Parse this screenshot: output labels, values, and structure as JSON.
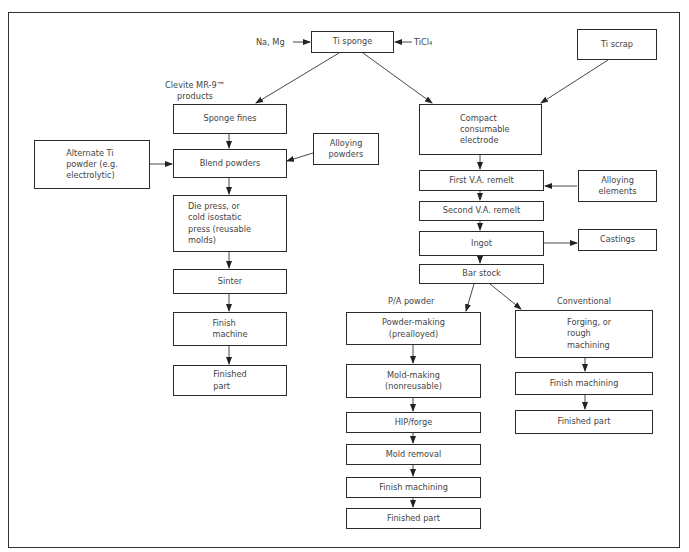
{
  "diagram": {
    "type": "flowchart"
  },
  "nodes": {
    "ti_sponge": "Ti sponge",
    "ti_scrap": "Ti scrap",
    "sponge_fines": "Sponge fines",
    "blend_powders": "Blend powders",
    "alternate_ti": "Alternate Ti\npowder (e.g.\nelectrolytic)",
    "alloying_powders": "Alloying\npowders",
    "die_press": "Die press, or\ncold isostatic\npress (reusable\nmolds)",
    "sinter": "Sinter",
    "finish_machine": "Finish\nmachine",
    "finished_part_left": "Finished\npart",
    "compact_electrode": "Compact\nconsumable\nelectrode",
    "first_va": "First V.A. remelt",
    "alloying_elements": "Alloying\nelements",
    "second_va": "Second V.A. remelt",
    "ingot": "Ingot",
    "castings": "Castings",
    "bar_stock": "Bar stock",
    "powder_making": "Powder-making\n(prealloyed)",
    "mold_making": "Mold-making\n(nonreusable)",
    "hip_forge": "HIP/forge",
    "mold_removal": "Mold removal",
    "finish_machining_pa": "Finish machining",
    "finished_part_pa": "Finished part",
    "forging": "Forging, or\nrough\nmachining",
    "finish_machining_conv": "Finish machining",
    "finished_part_conv": "Finished part"
  },
  "labels": {
    "na_mg": "Na, Mg",
    "ticl4": "TiCl₄",
    "clevite": "Clevite MR-9™\nproducts",
    "pa_powder": "P/A powder",
    "conventional": "Conventional"
  },
  "edges": [
    [
      "na_mg",
      "ti_sponge"
    ],
    [
      "ticl4",
      "ti_sponge"
    ],
    [
      "ti_sponge",
      "sponge_fines"
    ],
    [
      "ti_sponge",
      "compact_electrode"
    ],
    [
      "ti_scrap",
      "compact_electrode"
    ],
    [
      "sponge_fines",
      "blend_powders"
    ],
    [
      "alternate_ti",
      "blend_powders"
    ],
    [
      "alloying_powders",
      "blend_powders"
    ],
    [
      "blend_powders",
      "die_press"
    ],
    [
      "die_press",
      "sinter"
    ],
    [
      "sinter",
      "finish_machine"
    ],
    [
      "finish_machine",
      "finished_part_left"
    ],
    [
      "compact_electrode",
      "first_va"
    ],
    [
      "alloying_elements",
      "first_va"
    ],
    [
      "first_va",
      "second_va"
    ],
    [
      "second_va",
      "ingot"
    ],
    [
      "ingot",
      "castings"
    ],
    [
      "ingot",
      "bar_stock"
    ],
    [
      "bar_stock",
      "powder_making"
    ],
    [
      "bar_stock",
      "forging"
    ],
    [
      "powder_making",
      "mold_making"
    ],
    [
      "mold_making",
      "hip_forge"
    ],
    [
      "hip_forge",
      "mold_removal"
    ],
    [
      "mold_removal",
      "finish_machining_pa"
    ],
    [
      "finish_machining_pa",
      "finished_part_pa"
    ],
    [
      "forging",
      "finish_machining_conv"
    ],
    [
      "finish_machining_conv",
      "finished_part_conv"
    ]
  ]
}
